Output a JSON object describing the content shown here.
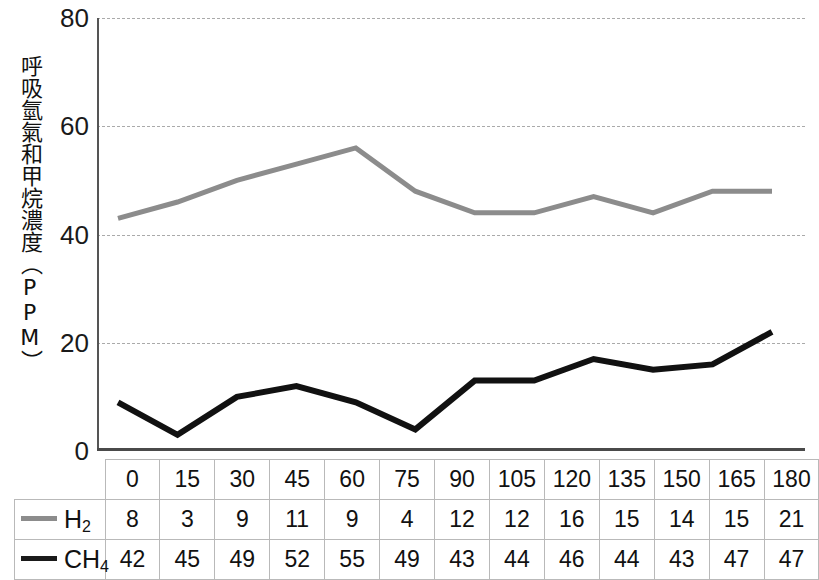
{
  "chart_data": {
    "type": "line",
    "title": "",
    "xlabel": "",
    "ylabel": "呼吸氫氣和甲烷濃度（PPM）",
    "ylim": [
      0,
      80
    ],
    "yticks": [
      0,
      20,
      40,
      60,
      80
    ],
    "grid": true,
    "legend_position": "table-left",
    "categories": [
      "0",
      "15",
      "30",
      "45",
      "60",
      "75",
      "90",
      "105",
      "120",
      "135",
      "150",
      "165",
      "180"
    ],
    "series": [
      {
        "name": "H₂",
        "name_base": "H",
        "name_sub": "2",
        "color": "#8c8c8c",
        "swatch_color": "#8c8c8c",
        "table_values": [
          8,
          3,
          9,
          11,
          9,
          4,
          12,
          12,
          16,
          15,
          14,
          15,
          21
        ]
      },
      {
        "name": "CH₄",
        "name_base": "CH",
        "name_sub": "4",
        "color": "#1a1a1a",
        "swatch_color": "#1a1a1a",
        "table_values": [
          42,
          45,
          49,
          52,
          55,
          49,
          43,
          44,
          46,
          44,
          43,
          47,
          47
        ]
      }
    ],
    "plotted_lines": [
      {
        "name": "upper-gray-line",
        "color": "#8c8c8c",
        "width": 5,
        "values": [
          43,
          46,
          50,
          53,
          56,
          48,
          44,
          44,
          47,
          44,
          48,
          48
        ]
      },
      {
        "name": "lower-black-line",
        "color": "#111111",
        "width": 6,
        "values": [
          9,
          3,
          10,
          12,
          9,
          4,
          13,
          13,
          17,
          15,
          16,
          22
        ]
      }
    ]
  }
}
